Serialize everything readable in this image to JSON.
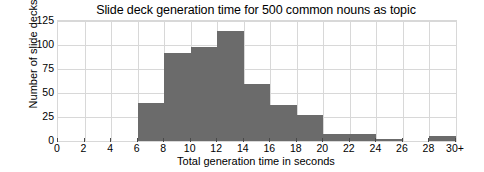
{
  "chart_data": {
    "type": "bar",
    "title": "Slide deck generation time for 500 common nouns as topic",
    "xlabel": "Total generation time in seconds",
    "ylabel": "Number of slide decks",
    "grid": true,
    "legend": "none",
    "bar_color": "#6b6b6b",
    "xlim": [
      0,
      30
    ],
    "ylim": [
      0,
      125
    ],
    "bin_width": 2,
    "xticks": [
      "0",
      "2",
      "4",
      "6",
      "8",
      "10",
      "12",
      "14",
      "16",
      "18",
      "20",
      "22",
      "24",
      "26",
      "28",
      "30+"
    ],
    "xtick_values": [
      0,
      2,
      4,
      6,
      8,
      10,
      12,
      14,
      16,
      18,
      20,
      22,
      24,
      26,
      28,
      30
    ],
    "yticks": [
      "0",
      "25",
      "50",
      "75",
      "100",
      "125"
    ],
    "ytick_values": [
      0,
      25,
      50,
      75,
      100,
      125
    ],
    "bins": [
      {
        "start": 0,
        "end": 2,
        "label": "0-2",
        "value": 0
      },
      {
        "start": 2,
        "end": 4,
        "label": "2-4",
        "value": 0
      },
      {
        "start": 4,
        "end": 6,
        "label": "4-6",
        "value": 0
      },
      {
        "start": 6,
        "end": 8,
        "label": "6-8",
        "value": 40
      },
      {
        "start": 8,
        "end": 10,
        "label": "8-10",
        "value": 92
      },
      {
        "start": 10,
        "end": 12,
        "label": "10-12",
        "value": 98
      },
      {
        "start": 12,
        "end": 14,
        "label": "12-14",
        "value": 115
      },
      {
        "start": 14,
        "end": 16,
        "label": "14-16",
        "value": 59
      },
      {
        "start": 16,
        "end": 18,
        "label": "16-18",
        "value": 38
      },
      {
        "start": 18,
        "end": 20,
        "label": "18-20",
        "value": 27
      },
      {
        "start": 20,
        "end": 22,
        "label": "20-22",
        "value": 7
      },
      {
        "start": 22,
        "end": 24,
        "label": "22-24",
        "value": 7
      },
      {
        "start": 24,
        "end": 26,
        "label": "24-26",
        "value": 2
      },
      {
        "start": 26,
        "end": 28,
        "label": "26-28",
        "value": 0
      },
      {
        "start": 28,
        "end": 30,
        "label": "28-30+",
        "value": 5
      }
    ],
    "categories": [
      "0-2",
      "2-4",
      "4-6",
      "6-8",
      "8-10",
      "10-12",
      "12-14",
      "14-16",
      "16-18",
      "18-20",
      "20-22",
      "22-24",
      "24-26",
      "26-28",
      "28-30+"
    ],
    "values": [
      0,
      0,
      0,
      40,
      92,
      98,
      115,
      59,
      38,
      27,
      7,
      7,
      2,
      0,
      5
    ]
  }
}
